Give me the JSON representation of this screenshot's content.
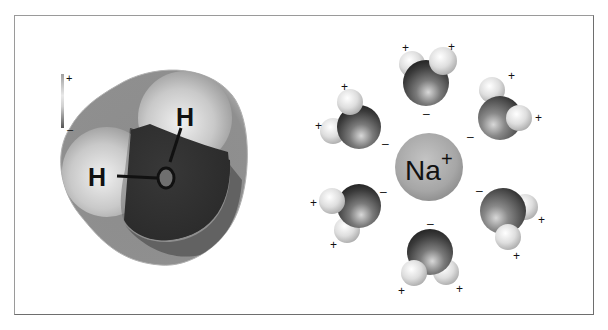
{
  "figure": {
    "left_panel": {
      "title": "Water molecule (space-filling, electrostatic potential)",
      "atom_labels": {
        "hydrogen_1": "H",
        "hydrogen_2": "H",
        "oxygen": "O"
      },
      "charge_scale": {
        "positive": "+",
        "negative": "–"
      }
    },
    "right_panel": {
      "center_ion": {
        "symbol": "Na",
        "charge": "+"
      },
      "water_molecules": [
        {
          "position": "top",
          "oxygen_charge": "–",
          "hydrogen_charges": [
            "+",
            "+"
          ]
        },
        {
          "position": "upper-left",
          "oxygen_charge": "–",
          "hydrogen_charges": [
            "+",
            "+"
          ]
        },
        {
          "position": "upper-right",
          "oxygen_charge": "–",
          "hydrogen_charges": [
            "+",
            "+"
          ]
        },
        {
          "position": "lower-left",
          "oxygen_charge": "–",
          "hydrogen_charges": [
            "+",
            "+"
          ]
        },
        {
          "position": "lower-right",
          "oxygen_charge": "–",
          "hydrogen_charges": [
            "+",
            "+"
          ]
        },
        {
          "position": "bottom",
          "oxygen_charge": "–",
          "hydrogen_charges": [
            "+",
            "+"
          ]
        }
      ]
    },
    "colors": {
      "frame_border": "#8a8a8a",
      "oxygen_dark": "#2e2e2e",
      "oxygen_mid": "#777777",
      "hydrogen_light": "#e6e6e6",
      "sodium": "#a8a8a8"
    }
  }
}
